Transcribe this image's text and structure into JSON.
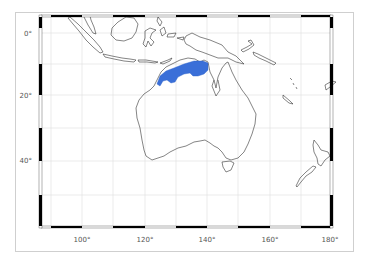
{
  "map": {
    "type": "species-range-map",
    "region": "Australasia",
    "projection": "Mercator",
    "extent": {
      "lon_min": 87,
      "lon_max": 184,
      "lat_min": -57,
      "lat_max": 6
    },
    "graticule_step_deg": 10,
    "colors": {
      "range_fill": "#3a6fd8",
      "coastline": "#333333",
      "graticule": "#dddddd",
      "frame": "#000000",
      "outer_border": "#cfcfcf",
      "label": "#555555"
    },
    "range_description": "Northern Australia: Kimberley, Top End and Gulf of Carpentaria coast",
    "lon_labels": [
      {
        "text": "100°",
        "lon": 100
      },
      {
        "text": "120°",
        "lon": 120
      },
      {
        "text": "140°",
        "lon": 140
      },
      {
        "text": "160°",
        "lon": 160
      },
      {
        "text": "180°",
        "lon": 180
      }
    ],
    "lat_labels": [
      {
        "text": "0°",
        "lat": 0
      },
      {
        "text": "20°",
        "lat": -20
      },
      {
        "text": "40°",
        "lat": -40
      }
    ]
  }
}
